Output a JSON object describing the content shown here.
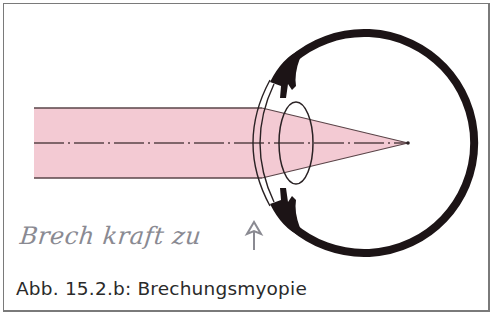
{
  "figure": {
    "caption": "Abb. 15.2.b: Brechungsmyopie",
    "handwritten_note": "Brech kraft zu",
    "handwritten_arrow": "up-arrow"
  },
  "diagram": {
    "elements": [
      "incoming-light-beam",
      "optical-axis",
      "cornea",
      "lens",
      "ciliary-body",
      "sclera",
      "focal-point"
    ],
    "colors": {
      "beam_fill": "#f2c6cf",
      "beam_edge": "#5a4448",
      "sclera": "#1c1416",
      "outline": "#2a2224",
      "frame": "#7a7a7a"
    }
  }
}
